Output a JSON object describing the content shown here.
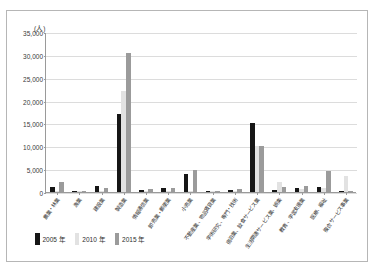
{
  "unit_label": "(人)",
  "legend": {
    "items": [
      {
        "label": "2005 年",
        "color": "#161616",
        "key": "y2005"
      },
      {
        "label": "2010 年",
        "color": "#e2e2e2",
        "key": "y2010"
      },
      {
        "label": "2015 年",
        "color": "#9b9b9b",
        "key": "y2015"
      }
    ]
  },
  "yticks": [
    "0",
    "5,000",
    "10,000",
    "15,000",
    "20,000",
    "25,000",
    "30,000",
    "35,000"
  ],
  "chart_data": {
    "type": "bar",
    "title": "",
    "xlabel": "",
    "ylabel": "(人)",
    "ylim": [
      0,
      35000
    ],
    "ytick_step": 5000,
    "grid": true,
    "legend_position": "bottom-left",
    "categories": [
      "農業・林業",
      "漁業",
      "建設業",
      "製造業",
      "情報通信業",
      "卸売業・郵便業",
      "小売業",
      "不動産業、物品賃貸業",
      "学術研究、専門・技術",
      "宿泊業、飲食サービス業",
      "生活関連サービス業、娯楽",
      "教育、学習支援業",
      "医療、福祉",
      "複合サービス事業"
    ],
    "series": [
      {
        "name": "2005 年",
        "color": "#161616",
        "values": [
          1100,
          300,
          1300,
          17000,
          400,
          800,
          4000,
          200,
          400,
          15000,
          500,
          900,
          1200,
          300
        ]
      },
      {
        "name": "2010 年",
        "color": "#e2e2e2",
        "values": [
          200,
          150,
          200,
          22000,
          200,
          200,
          200,
          100,
          150,
          10000,
          2300,
          700,
          800,
          3600
        ]
      },
      {
        "name": "2015 年",
        "color": "#9b9b9b",
        "values": [
          2100,
          250,
          900,
          30500,
          600,
          900,
          4800,
          150,
          600,
          10000,
          1000,
          1300,
          4500,
          150
        ]
      }
    ]
  }
}
